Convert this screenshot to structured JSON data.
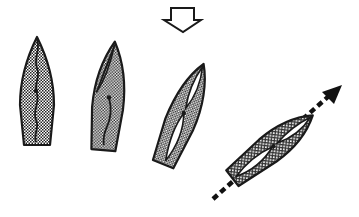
{
  "diagram": {
    "colors": {
      "background": "#ffffff",
      "outline": "#1a1a1a",
      "hull_fill": "#8c8c8c",
      "sail_fill": "#ffffff"
    },
    "wind_arrow": {
      "icon": "hollow-down-arrow-icon",
      "direction": "down",
      "style": "outline"
    },
    "boats": [
      {
        "index": 1,
        "heading_deg": 0,
        "sail_state": "luffing (wavy line)"
      },
      {
        "index": 2,
        "heading_deg": 5,
        "sail_state": "luffing (curved line)"
      },
      {
        "index": 3,
        "heading_deg": 25,
        "sail_state": "filling (jib and main)"
      },
      {
        "index": 4,
        "heading_deg": 50,
        "sail_state": "full (jib and main drawn in)"
      }
    ],
    "course_arrow": {
      "icon": "dashed-arrow-icon",
      "style": "dashed",
      "direction": "up-right"
    }
  }
}
